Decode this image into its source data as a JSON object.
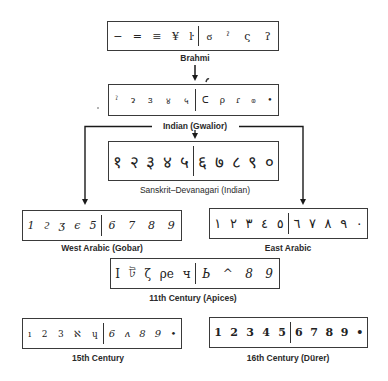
{
  "diagram": {
    "nodes": [
      {
        "id": "brahmi",
        "label": "Brahmi",
        "left_glyphs": [
          "−",
          "=",
          "≡",
          "¥",
          "ŀ"
        ],
        "right_glyphs": [
          "ϭ",
          "ˀ",
          "ς",
          "ʔ"
        ]
      },
      {
        "id": "indian-gwalior",
        "label": "Indian (Gwalior)",
        "left_glyphs": [
          "ˀ",
          "ɂ",
          "ɜ",
          "४",
          "५"
        ],
        "right_glyphs": [
          "ᑕ",
          "ρ",
          "ɾ",
          "ၜ",
          "•"
        ]
      },
      {
        "id": "sanskrit-devanagari",
        "label": "Sanskrit–Devanagari (Indian)",
        "left_glyphs": [
          "१",
          "२",
          "३",
          "४",
          "५"
        ],
        "right_glyphs": [
          "६",
          "७",
          "८",
          "९",
          "०"
        ]
      },
      {
        "id": "west-arabic",
        "label": "West Arabic (Gobar)",
        "left_glyphs": [
          "1",
          "ϩ",
          "ʒ",
          "ϵ",
          "5"
        ],
        "right_glyphs": [
          "6",
          "7",
          "8",
          "9"
        ]
      },
      {
        "id": "east-arabic",
        "label": "East Arabic",
        "left_glyphs": [
          "١",
          "٢",
          "٣",
          "٤",
          "٥"
        ],
        "right_glyphs": [
          "٦",
          "٧",
          "٨",
          "٩",
          "٠"
        ]
      },
      {
        "id": "11th-century",
        "label": "11th Century (Apices)",
        "left_glyphs": [
          "I",
          "ট",
          "ζ",
          "ρe",
          "ч"
        ],
        "right_glyphs": [
          "Ь",
          "^",
          "8",
          "9"
        ]
      },
      {
        "id": "15th-century",
        "label": "15th Century",
        "left_glyphs": [
          "ı",
          "2",
          "3",
          "ℵ",
          "ɥ"
        ],
        "right_glyphs": [
          "6",
          "ʌ",
          "8",
          "9",
          "•"
        ]
      },
      {
        "id": "16th-century",
        "label": "16th Century (Dürer)",
        "left_glyphs": [
          "1",
          "2",
          "3",
          "4",
          "5"
        ],
        "right_glyphs": [
          "6",
          "7",
          "8",
          "9",
          "•"
        ]
      }
    ],
    "edges": [
      {
        "from": "brahmi",
        "to": "indian-gwalior"
      },
      {
        "from": "indian-gwalior",
        "to": "sanskrit-devanagari"
      },
      {
        "from": "indian-gwalior",
        "to": "west-arabic"
      },
      {
        "from": "indian-gwalior",
        "to": "east-arabic"
      }
    ]
  }
}
